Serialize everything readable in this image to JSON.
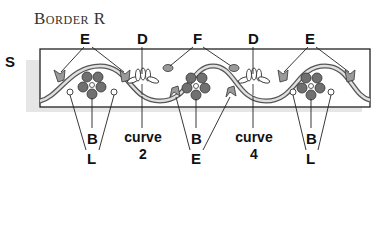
{
  "title": "Border R",
  "side_label": "S",
  "top_labels": [
    {
      "id": "E1",
      "text": "E",
      "x": 86
    },
    {
      "id": "D1",
      "text": "D",
      "x": 142
    },
    {
      "id": "F",
      "text": "F",
      "x": 197
    },
    {
      "id": "D2",
      "text": "D",
      "x": 253
    },
    {
      "id": "E2",
      "text": "E",
      "x": 310
    }
  ],
  "bottom_labels": [
    {
      "id": "B1",
      "text": "B",
      "x": 92,
      "y": 133
    },
    {
      "id": "L1",
      "text": "L",
      "x": 92,
      "y": 151
    },
    {
      "id": "curve2a",
      "text": "curve",
      "x": 142,
      "y": 133
    },
    {
      "id": "curve2b",
      "text": "2",
      "x": 142,
      "y": 151
    },
    {
      "id": "B2",
      "text": "B",
      "x": 196,
      "y": 133
    },
    {
      "id": "E3",
      "text": "E",
      "x": 196,
      "y": 151
    },
    {
      "id": "curve4a",
      "text": "curve",
      "x": 253,
      "y": 133
    },
    {
      "id": "curve4b",
      "text": "4",
      "x": 253,
      "y": 151
    },
    {
      "id": "B3",
      "text": "B",
      "x": 311,
      "y": 133
    },
    {
      "id": "L2",
      "text": "L",
      "x": 311,
      "y": 151
    }
  ],
  "colors": {
    "ink": "#222222",
    "petal": "#6e6e6e",
    "leaf": "#9a9a9a",
    "shadow": "#e4e4e4",
    "vine": "#d8d8d8"
  }
}
